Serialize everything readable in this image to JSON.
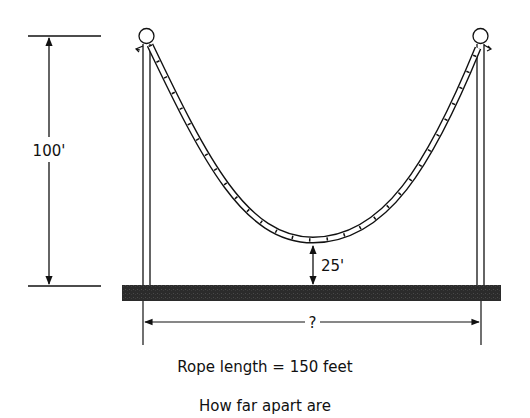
{
  "diagram": {
    "height_label": "100'",
    "sag_label": "25'",
    "distance_label": "?",
    "caption_line1": "Rope length = 150 feet",
    "caption_line2": "How far apart are",
    "colors": {
      "ink": "#111111",
      "ground": "#2b2b2b",
      "background": "#ffffff"
    }
  }
}
